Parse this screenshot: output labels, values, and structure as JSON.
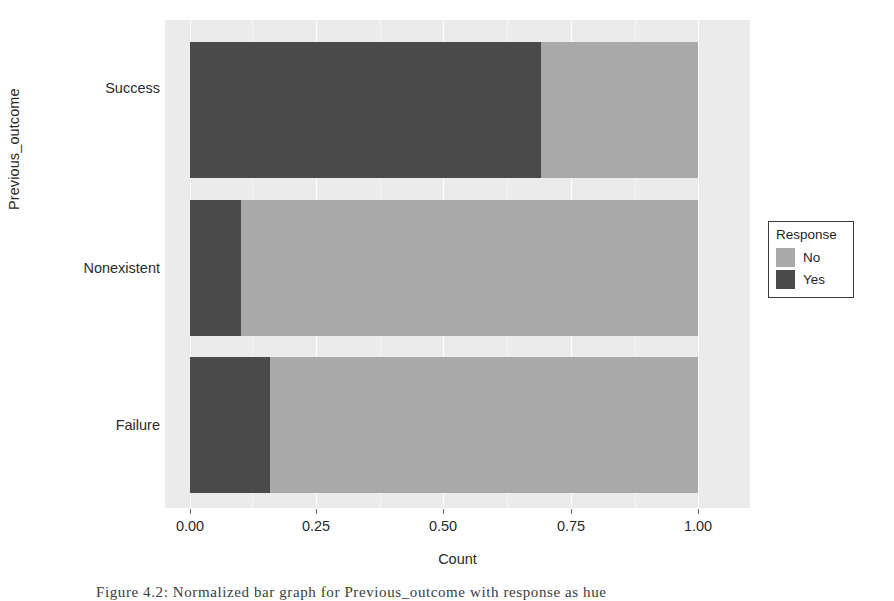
{
  "chart_data": {
    "type": "bar",
    "orientation": "horizontal",
    "stacked": true,
    "normalized": true,
    "title": "",
    "xlabel": "Count",
    "ylabel": "Previous_outcome",
    "categories": [
      "Failure",
      "Nonexistent",
      "Success"
    ],
    "categories_top_to_bottom": [
      "Success",
      "Nonexistent",
      "Failure"
    ],
    "series": [
      {
        "name": "Yes",
        "color": "#4a4a4a",
        "values": [
          0.157,
          0.1,
          0.69
        ]
      },
      {
        "name": "No",
        "color": "#a9a9a9",
        "values": [
          0.843,
          0.9,
          0.31
        ]
      }
    ],
    "xlim": [
      0.0,
      1.0
    ],
    "xticks": [
      0.0,
      0.25,
      0.5,
      0.75,
      1.0
    ],
    "xtick_labels": [
      "0.00",
      "0.25",
      "0.50",
      "0.75",
      "1.00"
    ],
    "grid": true,
    "legend_position": "right",
    "legend_title": "Response",
    "legend_entries": [
      "No",
      "Yes"
    ],
    "panel_background": "#ebebeb"
  },
  "axes": {
    "y_title": "Previous_outcome",
    "x_title": "Count",
    "y_ticks": [
      {
        "label": "Success"
      },
      {
        "label": "Nonexistent"
      },
      {
        "label": "Failure"
      }
    ],
    "x_ticks": [
      {
        "label": "0.00"
      },
      {
        "label": "0.25"
      },
      {
        "label": "0.50"
      },
      {
        "label": "0.75"
      },
      {
        "label": "1.00"
      }
    ]
  },
  "legend": {
    "title": "Response",
    "items": [
      {
        "label": "No",
        "color": "#a9a9a9"
      },
      {
        "label": "Yes",
        "color": "#4a4a4a"
      }
    ]
  },
  "caption": {
    "text": "Figure 4.2:  Normalized bar graph for Previous_outcome with response as hue"
  }
}
